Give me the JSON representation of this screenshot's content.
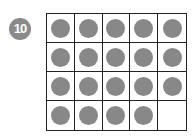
{
  "badge": {
    "label": "10",
    "color": "#8a8a8a"
  },
  "ten_frame": {
    "rows": 4,
    "columns": 5,
    "filled_count": 19,
    "dot_color": "#888888",
    "cells": [
      true,
      true,
      true,
      true,
      true,
      true,
      true,
      true,
      true,
      true,
      true,
      true,
      true,
      true,
      true,
      true,
      true,
      true,
      true,
      false
    ]
  }
}
